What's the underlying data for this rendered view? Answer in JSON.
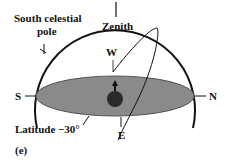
{
  "labels": {
    "south_celestial_pole_line1": "South celestial",
    "south_celestial_pole_line2": "pole",
    "zenith": "Zenith",
    "west": "W",
    "south": "S",
    "north": "N",
    "east": "E",
    "latitude": "Latitude −30°",
    "panel": "(e)"
  },
  "colors": {
    "horizon_plane": "#8a8a8a",
    "lines": "#111111",
    "observer": "#2a2a2a"
  }
}
